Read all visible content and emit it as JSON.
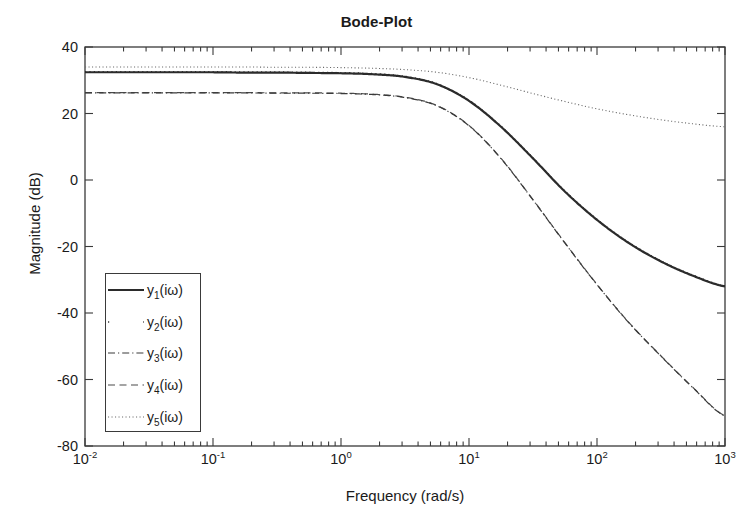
{
  "chart_data": {
    "type": "line",
    "title": "Bode-Plot",
    "xlabel": "Frequency (rad/s)",
    "ylabel": "Magnitude (dB)",
    "xscale": "log",
    "xlim": [
      0.01,
      1000
    ],
    "ylim": [
      -80,
      40
    ],
    "grid": false,
    "legend_position": "lower left",
    "xtick_labels": [
      "10-2",
      "10-1",
      "100",
      "101",
      "102",
      "103"
    ],
    "xtick_mantissa": [
      "10",
      "10",
      "10",
      "10",
      "10",
      "10"
    ],
    "xtick_exponents": [
      "-2",
      "-1",
      "0",
      "1",
      "2",
      "3"
    ],
    "xtick_values": [
      0.01,
      0.1,
      1,
      10,
      100,
      1000
    ],
    "ytick_labels": [
      "40",
      "20",
      "0",
      "-20",
      "-40",
      "-60",
      "-80"
    ],
    "ytick_values": [
      40,
      20,
      0,
      -20,
      -40,
      -60,
      -80
    ],
    "x": [
      0.01,
      0.0178,
      0.0316,
      0.0562,
      0.1,
      0.178,
      0.316,
      0.562,
      1,
      1.78,
      3.16,
      5.62,
      10,
      17.8,
      31.6,
      56.2,
      100,
      178,
      316,
      562,
      1000
    ],
    "series": [
      {
        "name": "y1(iw)",
        "label_base": "y",
        "label_sub": "1",
        "label_tail": "(iω)",
        "style": "solid",
        "color": "#2b2b2b",
        "width": 2.2,
        "values": [
          32.4,
          32.4,
          32.4,
          32.4,
          32.4,
          32.3,
          32.3,
          32.2,
          32.1,
          31.8,
          31.0,
          28.8,
          23.8,
          16.0,
          6.5,
          -3.5,
          -12.0,
          -19.0,
          -24.5,
          -28.8,
          -32.0
        ]
      },
      {
        "name": "y2(iw)",
        "label_base": "y",
        "label_sub": "2",
        "label_tail": "(iω)",
        "style": "dotted-sparse",
        "color": "#3a3a3a",
        "width": 1.3,
        "values": [
          32.6,
          32.6,
          32.6,
          32.6,
          32.6,
          32.5,
          32.5,
          32.4,
          32.3,
          32.0,
          31.2,
          29.0,
          24.0,
          16.2,
          6.7,
          -3.3,
          -11.8,
          -18.8,
          -24.3,
          -28.6,
          -31.8
        ]
      },
      {
        "name": "y3(iw)",
        "label_base": "y",
        "label_sub": "3",
        "label_tail": "(iω)",
        "style": "dashdot",
        "color": "#3a3a3a",
        "width": 1.2,
        "values": [
          26.2,
          26.2,
          26.2,
          26.2,
          26.2,
          26.2,
          26.1,
          26.1,
          26.0,
          25.7,
          24.8,
          22.3,
          16.3,
          6.4,
          -6.0,
          -19.0,
          -31.5,
          -43.0,
          -53.0,
          -62.5,
          -71.0
        ]
      },
      {
        "name": "y4(iw)",
        "label_base": "y",
        "label_sub": "4",
        "label_tail": "(iω)",
        "style": "dashed",
        "color": "#4a4a4a",
        "width": 1.2,
        "values": [
          26.3,
          26.3,
          26.3,
          26.3,
          26.3,
          26.3,
          26.2,
          26.2,
          26.1,
          25.8,
          24.9,
          22.4,
          16.4,
          6.5,
          -5.9,
          -18.9,
          -31.4,
          -42.9,
          -52.9,
          -62.4,
          -70.9
        ]
      },
      {
        "name": "y5(iw)",
        "label_base": "y",
        "label_sub": "5",
        "label_tail": "(iω)",
        "style": "dotted-fine",
        "color": "#6a6a6a",
        "width": 1.1,
        "values": [
          34.0,
          34.0,
          34.0,
          34.0,
          34.0,
          34.0,
          33.9,
          33.9,
          33.8,
          33.6,
          33.2,
          32.4,
          30.8,
          28.5,
          26.0,
          23.6,
          21.4,
          19.6,
          18.1,
          16.9,
          16.0
        ]
      }
    ]
  },
  "axes": {
    "title": "Bode-Plot",
    "x_axis_label": "Frequency (rad/s)",
    "y_axis_label": "Magnitude (dB)"
  }
}
